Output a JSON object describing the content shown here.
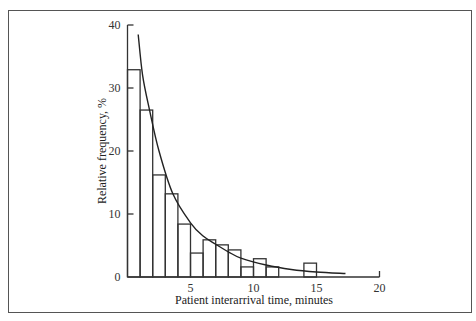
{
  "chart_data": {
    "type": "bar",
    "subtype": "histogram_with_fitted_curve",
    "title": "",
    "xlabel": "Patient interarrival time, minutes",
    "ylabel": "Relative frequency, %",
    "xlim": [
      0,
      20
    ],
    "ylim": [
      0,
      40
    ],
    "x_ticks": [
      5,
      10,
      15,
      20
    ],
    "x_tick_labels": [
      "5",
      "10",
      "15",
      "20"
    ],
    "y_ticks": [
      0,
      10,
      20,
      30,
      40
    ],
    "y_tick_labels": [
      "0",
      "10",
      "20",
      "30",
      "40"
    ],
    "grid": false,
    "legend": null,
    "bins": [
      {
        "from": 0,
        "to": 1,
        "value": 32.9
      },
      {
        "from": 1,
        "to": 2,
        "value": 26.5
      },
      {
        "from": 2,
        "to": 3,
        "value": 16.2
      },
      {
        "from": 3,
        "to": 4,
        "value": 13.2
      },
      {
        "from": 4,
        "to": 5,
        "value": 8.4
      },
      {
        "from": 5,
        "to": 6,
        "value": 3.8
      },
      {
        "from": 6,
        "to": 7,
        "value": 5.9
      },
      {
        "from": 7,
        "to": 8,
        "value": 5.1
      },
      {
        "from": 8,
        "to": 9,
        "value": 4.3
      },
      {
        "from": 9,
        "to": 10,
        "value": 1.6
      },
      {
        "from": 10,
        "to": 11,
        "value": 2.9
      },
      {
        "from": 11,
        "to": 12,
        "value": 1.6
      },
      {
        "from": 14,
        "to": 15,
        "value": 2.2
      }
    ],
    "series": [
      {
        "name": "Fitted exponential curve",
        "type": "line",
        "x": [
          0.85,
          1.2,
          1.75,
          2.5,
          3.6,
          5,
          6,
          7,
          8,
          9,
          11,
          13,
          15,
          17.3
        ],
        "values": [
          38.5,
          32.0,
          26.5,
          20.0,
          13.2,
          8.6,
          6.5,
          5.2,
          4.0,
          3.0,
          1.9,
          1.2,
          0.8,
          0.55
        ]
      }
    ]
  }
}
